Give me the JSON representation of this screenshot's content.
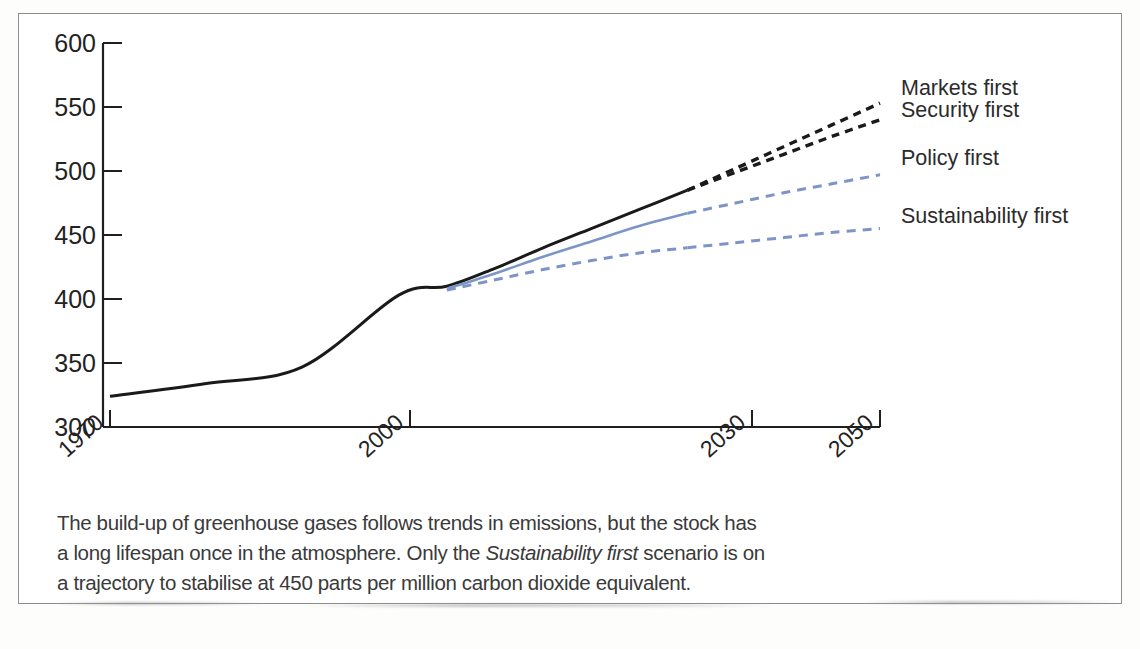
{
  "figure": {
    "caption_line1": "The build-up of greenhouse gases follows trends in emissions, but the stock has",
    "caption_line2_a": "a long lifespan once in the atmosphere. Only the ",
    "caption_line2_italic": "Sustainability first",
    "caption_line2_b": " scenario is on",
    "caption_line3": "a trajectory to stabilise at 450 parts per million carbon dioxide equivalent."
  },
  "chart_data": {
    "type": "line",
    "title": "",
    "xlabel": "",
    "ylabel": "",
    "xlim": [
      1970,
      2050
    ],
    "ylim": [
      300,
      600
    ],
    "grid": false,
    "legend_position": "right-outside",
    "x_ticks": [
      "1970",
      "2000",
      "2030",
      "2050"
    ],
    "x_tick_values": [
      1970,
      2000,
      2030,
      2050
    ],
    "y_ticks": [
      "300",
      "350",
      "400",
      "450",
      "500",
      "550",
      "600"
    ],
    "y_tick_values": [
      300,
      350,
      400,
      450,
      500,
      550,
      600
    ],
    "units": "parts per million carbon dioxide equivalent",
    "annotations": [
      "450 ppm stabilisation target"
    ],
    "series": [
      {
        "name": "Markets first",
        "color": "#1a1a1a",
        "style": "dashed",
        "x": [
          2030,
          2035,
          2040,
          2045,
          2050
        ],
        "values": [
          485,
          502,
          519,
          536,
          553
        ]
      },
      {
        "name": "Security first",
        "color": "#1a1a1a",
        "style": "dashed",
        "x": [
          2030,
          2035,
          2040,
          2045,
          2050
        ],
        "values": [
          485,
          499,
          513,
          527,
          540
        ]
      },
      {
        "name": "Policy first",
        "color": "#7d95c6",
        "style": "dashed",
        "x": [
          2030,
          2035,
          2040,
          2045,
          2050
        ],
        "values": [
          467,
          475,
          483,
          490,
          497
        ]
      },
      {
        "name": "Sustainability first",
        "color": "#7d95c6",
        "style": "dashed",
        "x": [
          2030,
          2035,
          2040,
          2045,
          2050
        ],
        "values": [
          440,
          444,
          448,
          452,
          455
        ]
      },
      {
        "name": "Historical / common trend",
        "color": "#1a1a1a",
        "style": "solid",
        "x": [
          1970,
          1980,
          1990,
          2000,
          2005,
          2010,
          2015,
          2020,
          2025,
          2030
        ],
        "values": [
          324,
          334,
          347,
          403,
          410,
          424,
          440,
          455,
          470,
          485
        ]
      },
      {
        "name": "Policy first historical branch",
        "color": "#7d95c6",
        "style": "solid",
        "x": [
          2005,
          2010,
          2015,
          2020,
          2025,
          2030
        ],
        "values": [
          408,
          420,
          433,
          445,
          457,
          467
        ]
      },
      {
        "name": "Sustainability first historical branch",
        "color": "#7d95c6",
        "style": "dashed",
        "x": [
          2005,
          2010,
          2015,
          2020,
          2025,
          2030
        ],
        "values": [
          407,
          415,
          423,
          430,
          436,
          440
        ]
      }
    ]
  },
  "legend": {
    "items": [
      {
        "label": "Markets first"
      },
      {
        "label": "Security first"
      },
      {
        "label": "Policy first"
      },
      {
        "label": "Sustainability first"
      }
    ]
  },
  "axes": {
    "y_labels": [
      "600",
      "550",
      "500",
      "450",
      "400",
      "350",
      "300"
    ],
    "x_labels": [
      "1970",
      "2000",
      "2030",
      "2050"
    ]
  },
  "colors": {
    "black_line": "#1a1a1a",
    "blue_line": "#7d95c6",
    "axis": "#1f1f1f",
    "frame": "#8d8d8d",
    "text": "#2b2b2b"
  }
}
